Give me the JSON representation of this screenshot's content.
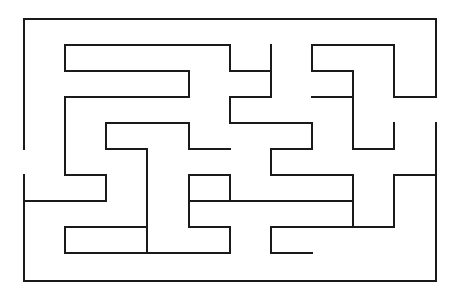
{
  "maze": {
    "width": 461,
    "height": 298,
    "wall_color": "#1a1a1a",
    "background": "#ffffff",
    "grid": {
      "x": [
        24,
        65,
        106,
        147,
        189,
        230,
        271,
        312,
        353,
        394,
        436
      ],
      "y": [
        19,
        45,
        71,
        97,
        123,
        149,
        175,
        201,
        227,
        253,
        281
      ]
    },
    "walls": [
      [
        0,
        0,
        10,
        0
      ],
      [
        10,
        0,
        10,
        3
      ],
      [
        0,
        0,
        0,
        5
      ],
      [
        0,
        6,
        0,
        10
      ],
      [
        0,
        10,
        10,
        10
      ],
      [
        10,
        4,
        10,
        10
      ],
      [
        1,
        1,
        5,
        1
      ],
      [
        1,
        1,
        1,
        2
      ],
      [
        1,
        2,
        4,
        2
      ],
      [
        4,
        2,
        4,
        3
      ],
      [
        1,
        3,
        4,
        3
      ],
      [
        1,
        3,
        1,
        6
      ],
      [
        1,
        6,
        2,
        6
      ],
      [
        2,
        6,
        2,
        7
      ],
      [
        0,
        7,
        2,
        7
      ],
      [
        2,
        4,
        4,
        4
      ],
      [
        2,
        4,
        2,
        5
      ],
      [
        2,
        5,
        3,
        5
      ],
      [
        3,
        5,
        3,
        9
      ],
      [
        1,
        8,
        3,
        8
      ],
      [
        1,
        8,
        1,
        9
      ],
      [
        1,
        9,
        5,
        9
      ],
      [
        5,
        8,
        5,
        9
      ],
      [
        4,
        4,
        4,
        5
      ],
      [
        4,
        5,
        5,
        5
      ],
      [
        4,
        6,
        5,
        6
      ],
      [
        4,
        6,
        4,
        8
      ],
      [
        4,
        8,
        5,
        8
      ],
      [
        5,
        6,
        5,
        7
      ],
      [
        5,
        7,
        8,
        7
      ],
      [
        8,
        6,
        8,
        7
      ],
      [
        6,
        6,
        8,
        6
      ],
      [
        6,
        5,
        6,
        6
      ],
      [
        6,
        5,
        7,
        5
      ],
      [
        7,
        4,
        7,
        5
      ],
      [
        5,
        4,
        7,
        4
      ],
      [
        5,
        3,
        5,
        4
      ],
      [
        5,
        3,
        6,
        3
      ],
      [
        6,
        1,
        6,
        3
      ],
      [
        5,
        1,
        5,
        2
      ],
      [
        5,
        2,
        6,
        2
      ],
      [
        7,
        1,
        9,
        1
      ],
      [
        7,
        1,
        7,
        2
      ],
      [
        7,
        2,
        8,
        2
      ],
      [
        8,
        2,
        8,
        5
      ],
      [
        7,
        3,
        8,
        3
      ],
      [
        8,
        5,
        9,
        5
      ],
      [
        9,
        4,
        9,
        5
      ],
      [
        9,
        1,
        9,
        3
      ],
      [
        9,
        3,
        10,
        3
      ],
      [
        9,
        6,
        10,
        6
      ],
      [
        9,
        6,
        9,
        8
      ],
      [
        8,
        8,
        9,
        8
      ],
      [
        8,
        7,
        8,
        8
      ],
      [
        6,
        7,
        8,
        7
      ],
      [
        6,
        8,
        6,
        9
      ],
      [
        6,
        9,
        7,
        9
      ],
      [
        6,
        8,
        8,
        8
      ],
      [
        4,
        7,
        5,
        7
      ]
    ]
  }
}
